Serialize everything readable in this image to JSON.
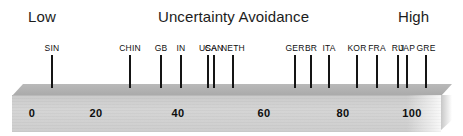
{
  "header": {
    "low_label": "Low",
    "title": "Uncertainty Avoidance",
    "high_label": "High"
  },
  "chart_data": {
    "type": "scatter",
    "title": "Uncertainty Avoidance",
    "subtitle": "",
    "xlabel": "",
    "ylabel": "",
    "xlim": [
      0,
      112
    ],
    "grid": false,
    "legend_position": "none",
    "annotations": [
      "Low",
      "High"
    ],
    "axis_ticks": [
      {
        "value": 0,
        "label": "0",
        "x_px": 32
      },
      {
        "value": 20,
        "label": "20",
        "x_px": 96
      },
      {
        "value": 40,
        "label": "40",
        "x_px": 178
      },
      {
        "value": 60,
        "label": "60",
        "x_px": 264
      },
      {
        "value": 80,
        "label": "80",
        "x_px": 343
      },
      {
        "value": 100,
        "label": "100",
        "x_px": 412
      }
    ],
    "points": [
      {
        "label": "SIN",
        "value": 8,
        "x_px": 52
      },
      {
        "label": "CHIN",
        "value": 30,
        "x_px": 130
      },
      {
        "label": "GB",
        "value": 35,
        "x_px": 161
      },
      {
        "label": "IN",
        "value": 40,
        "x_px": 181
      },
      {
        "label": "USA",
        "value": 46,
        "x_px": 208
      },
      {
        "label": "CAN",
        "value": 48,
        "x_px": 214
      },
      {
        "label": "NETH",
        "value": 53,
        "x_px": 233
      },
      {
        "label": "GER",
        "value": 65,
        "x_px": 295
      },
      {
        "label": "BR",
        "value": 76,
        "x_px": 311
      },
      {
        "label": "ITA",
        "value": 75,
        "x_px": 329
      },
      {
        "label": "KOR",
        "value": 85,
        "x_px": 357
      },
      {
        "label": "FRA",
        "value": 86,
        "x_px": 377
      },
      {
        "label": "RU",
        "value": 95,
        "x_px": 398
      },
      {
        "label": "JAP",
        "value": 92,
        "x_px": 407
      },
      {
        "label": "GRE",
        "value": 100,
        "x_px": 426
      }
    ]
  },
  "colors": {
    "bar_face": "#cfcfcf",
    "bar_top": "#b0b0b0",
    "tick": "#151515",
    "text": "#101010",
    "background": "#ffffff"
  }
}
